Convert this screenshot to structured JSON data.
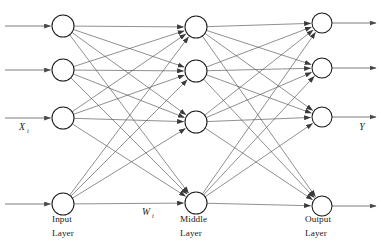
{
  "figure": {
    "type": "neural-network-diagram",
    "background_color": "#ffffff",
    "line_color": "#4a4a4a",
    "node_stroke_color": "#1a1a1a",
    "node_fill_color": "#ffffff",
    "text_color": "#1a1a1a",
    "width": 381,
    "height": 250
  },
  "labels": {
    "input_layer_line1": "Input",
    "input_layer_line2": "Layer",
    "middle_layer_line1": "Middle",
    "middle_layer_line2": "Layer",
    "output_layer_line1": "Output",
    "output_layer_line2": "Layer",
    "input_signal": "X",
    "input_signal_subscript": "i",
    "weight_symbol": "W",
    "weight_subscript": "i",
    "output_signal": "Y"
  },
  "chart_data": {
    "type": "diagram",
    "title": "",
    "layers": [
      {
        "name": "Input Layer",
        "id": "input",
        "x": 63,
        "node_radius": 11,
        "node_count": 4,
        "node_y": [
          26,
          70,
          118,
          204
        ]
      },
      {
        "name": "Middle Layer",
        "id": "middle",
        "x": 196,
        "node_radius": 11,
        "node_count": 4,
        "node_y": [
          27,
          71,
          122,
          203
        ]
      },
      {
        "name": "Output Layer",
        "id": "output",
        "x": 322,
        "node_radius": 10,
        "node_count": 4,
        "node_y": [
          23,
          68,
          117,
          206
        ]
      }
    ],
    "connections": [
      {
        "from": "input",
        "to": "middle",
        "pattern": "fully-connected",
        "count": 16
      },
      {
        "from": "middle",
        "to": "output",
        "pattern": "fully-connected",
        "count": 16
      }
    ],
    "external_inputs": {
      "count": 4,
      "x_start": 5,
      "direction": "right"
    },
    "external_outputs": {
      "count": 4,
      "x_end": 376,
      "direction": "right"
    },
    "label_positions": {
      "input_signal": {
        "x": 22,
        "y": 130
      },
      "weight_symbol": {
        "x": 146,
        "y": 215
      },
      "output_signal": {
        "x": 362,
        "y": 130
      },
      "input_layer": {
        "x": 52,
        "y": 222
      },
      "middle_layer": {
        "x": 180,
        "y": 222
      },
      "output_layer": {
        "x": 305,
        "y": 222
      }
    }
  }
}
